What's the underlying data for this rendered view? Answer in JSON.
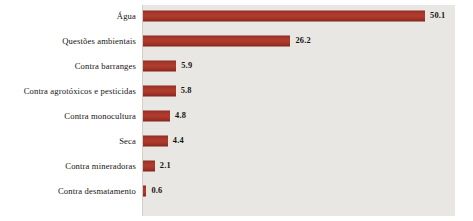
{
  "chart_data": {
    "type": "bar",
    "orientation": "horizontal",
    "title": "",
    "subtitle": "",
    "xlabel": "",
    "ylabel": "",
    "categories": [
      "Água",
      "Questões ambientais",
      "Contra barranges",
      "Contra agrotóxicos e pesticidas",
      "Contra monocultura",
      "Seca",
      "Contra mineradoras",
      "Contra desmatamento"
    ],
    "values": [
      50.1,
      26.2,
      5.9,
      5.8,
      4.8,
      4.4,
      2.1,
      0.6
    ],
    "value_labels": [
      "50.1",
      "26.2",
      "5.9",
      "5.8",
      "4.8",
      "4.4",
      "2.1",
      "0.6"
    ],
    "xlim": [
      0,
      55
    ],
    "grid": false,
    "legend": false,
    "legend_position": "none",
    "bar_color": "#a5342a",
    "plot_background": "#e9e7e3",
    "page_background": "#ffffff",
    "text_color": "#17130f"
  }
}
